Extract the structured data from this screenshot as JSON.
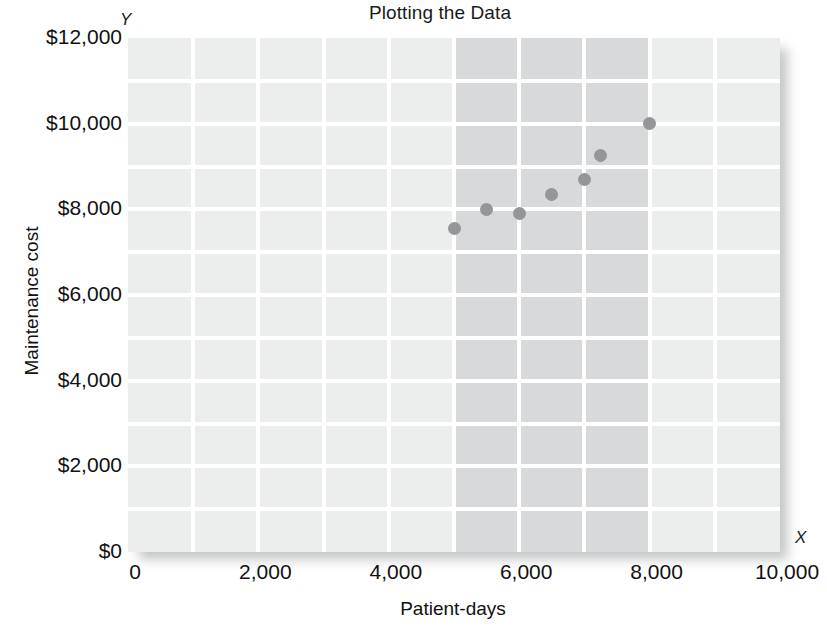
{
  "chart_data": {
    "type": "scatter",
    "title": "Plotting the Data",
    "xlabel": "Patient-days",
    "ylabel": "Maintenance cost",
    "x_axis_letter": "X",
    "y_axis_letter": "Y",
    "xlim": [
      0,
      10000
    ],
    "ylim": [
      0,
      12000
    ],
    "x_tick_labels": [
      "0",
      "2,000",
      "4,000",
      "6,000",
      "8,000",
      "10,000"
    ],
    "x_tick_values": [
      0,
      2000,
      4000,
      6000,
      8000,
      10000
    ],
    "y_tick_labels": [
      "$0",
      "$2,000",
      "$4,000",
      "$6,000",
      "$8,000",
      "$10,000",
      "$12,000"
    ],
    "y_tick_values": [
      0,
      2000,
      4000,
      6000,
      8000,
      10000,
      12000
    ],
    "grid": true,
    "grid_step_x": 1000,
    "grid_step_y": 1000,
    "legend": null,
    "highlight_band": {
      "x_start": 5000,
      "x_end": 8000
    },
    "points": [
      {
        "x": 5000,
        "y": 7550
      },
      {
        "x": 5500,
        "y": 8000
      },
      {
        "x": 6000,
        "y": 7900
      },
      {
        "x": 6500,
        "y": 8350
      },
      {
        "x": 7000,
        "y": 8700
      },
      {
        "x": 7250,
        "y": 9250
      },
      {
        "x": 8000,
        "y": 10000
      }
    ],
    "colors": {
      "panel": "#eceded",
      "band": "#d7d9da",
      "gridline": "#ffffff",
      "point": "#949699",
      "text": "#111111"
    }
  }
}
